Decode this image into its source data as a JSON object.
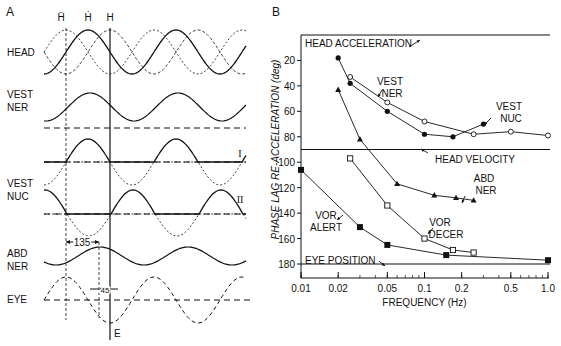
{
  "panel_a": {
    "label": "A",
    "top_labels": {
      "head_accel": "Ḧ",
      "head_vel": "Ḣ",
      "head_pos": "H"
    },
    "rows": [
      {
        "id": "head",
        "lines": [
          "HEAD"
        ]
      },
      {
        "id": "vest_ner",
        "lines": [
          "VEST",
          "NER"
        ]
      },
      {
        "id": "vest_nuc",
        "lines": [
          "VEST",
          "NUC"
        ]
      },
      {
        "id": "abd_ner",
        "lines": [
          "ABD",
          "NER"
        ]
      },
      {
        "id": "eye",
        "lines": [
          "EYE"
        ]
      }
    ],
    "type_labels": {
      "type1": "I",
      "type2": "II"
    },
    "phase_annotations": {
      "abd_lag": "135",
      "eye_lag": "45"
    },
    "marker_E": "E"
  },
  "panel_b": {
    "label": "B",
    "reference_lines": {
      "head_acceleration": "HEAD ACCELERATION",
      "head_velocity": "HEAD VELOCITY",
      "eye_position": "EYE POSITION"
    },
    "series_labels": {
      "vest_ner": [
        "VEST",
        "NER"
      ],
      "vest_nuc": [
        "VEST",
        "NUC"
      ],
      "abd_ner": [
        "ABD",
        "NER"
      ],
      "vor_decer": [
        "VOR",
        "DECER"
      ],
      "vor_alert": [
        "VOR",
        "ALERT"
      ]
    }
  },
  "chart_data": {
    "type": "line",
    "title": "",
    "xlabel": "FREQUENCY (Hz)",
    "ylabel": "PHASE LAG RE-ACCELERATION (deg)",
    "xscale": "log",
    "xlim": [
      0.01,
      1.0
    ],
    "ylim": [
      0,
      180
    ],
    "y_inverted": true,
    "x_ticks": [
      "0.01",
      "0.02",
      "0.05",
      "0.1",
      "0.2",
      "0.5",
      "1.0"
    ],
    "x_tick_values": [
      0.01,
      0.02,
      0.05,
      0.1,
      0.2,
      0.5,
      1.0
    ],
    "y_ticks": [
      "20",
      "40",
      "60",
      "80",
      "100",
      "120",
      "140",
      "160",
      "180"
    ],
    "y_tick_values": [
      20,
      40,
      60,
      80,
      100,
      120,
      140,
      160,
      180
    ],
    "grid": false,
    "reference_lines": [
      {
        "name": "HEAD ACCELERATION",
        "y": 0
      },
      {
        "name": "HEAD VELOCITY",
        "y": 90
      },
      {
        "name": "EYE POSITION",
        "y": 180
      }
    ],
    "series": [
      {
        "name": "VEST NER",
        "marker": "open-circle",
        "x": [
          0.025,
          0.05,
          0.1,
          0.25,
          0.5,
          1.0
        ],
        "y": [
          33,
          53,
          68,
          78,
          76,
          79
        ]
      },
      {
        "name": "VEST NUC",
        "marker": "filled-circle",
        "x": [
          0.02,
          0.025,
          0.05,
          0.1,
          0.17,
          0.3
        ],
        "y": [
          18,
          38,
          60,
          78,
          80,
          70
        ]
      },
      {
        "name": "ABD NER",
        "marker": "filled-triangle",
        "x": [
          0.02,
          0.03,
          0.06,
          0.12,
          0.18,
          0.25
        ],
        "y": [
          43,
          82,
          117,
          126,
          128,
          130
        ]
      },
      {
        "name": "VOR DECER",
        "marker": "open-square",
        "x": [
          0.025,
          0.05,
          0.1,
          0.17,
          0.25
        ],
        "y": [
          97,
          134,
          160,
          169,
          171
        ]
      },
      {
        "name": "VOR ALERT",
        "marker": "filled-square",
        "x": [
          0.01,
          0.03,
          0.05,
          0.15,
          1.0
        ],
        "y": [
          106,
          151,
          165,
          173,
          177
        ]
      }
    ]
  }
}
